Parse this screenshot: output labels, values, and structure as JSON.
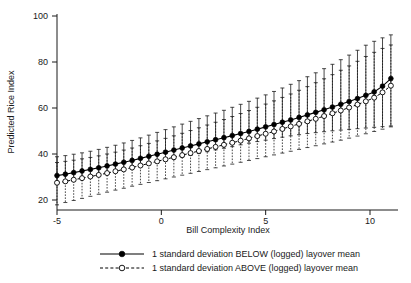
{
  "chart_data": {
    "type": "line",
    "title": "",
    "xlabel": "Bill Complexity Index",
    "ylabel": "Predicted Rice Index",
    "xlim": [
      -5.4,
      11.4
    ],
    "ylim": [
      14,
      102
    ],
    "xticks": [
      -5,
      0,
      5,
      10
    ],
    "xtick_labels": [
      "-5",
      "0",
      "5",
      "10"
    ],
    "yticks": [
      20,
      40,
      60,
      80,
      100
    ],
    "ytick_labels": [
      "20",
      "40",
      "60",
      "80",
      "100"
    ],
    "grid": false,
    "legend_position": "below",
    "error_bars": "95% confidence interval",
    "x": [
      -5.0,
      -4.6,
      -4.2,
      -3.8,
      -3.4,
      -3.0,
      -2.6,
      -2.2,
      -1.8,
      -1.4,
      -1.0,
      -0.6,
      -0.2,
      0.2,
      0.6,
      1.0,
      1.4,
      1.8,
      2.2,
      2.6,
      3.0,
      3.4,
      3.8,
      4.2,
      4.6,
      5.0,
      5.4,
      5.8,
      6.2,
      6.6,
      7.0,
      7.4,
      7.8,
      8.2,
      8.6,
      9.0,
      9.4,
      9.8,
      10.2,
      10.6,
      11.0
    ],
    "series": [
      {
        "name": "1 standard deviation BELOW (logged) layover mean",
        "marker": "filled-circle",
        "line": "solid",
        "values": [
          30.6,
          31.2,
          31.9,
          32.6,
          33.3,
          34.0,
          34.8,
          35.6,
          36.4,
          37.2,
          38.1,
          39.0,
          39.9,
          40.8,
          41.7,
          42.6,
          43.5,
          44.4,
          45.3,
          46.2,
          47.1,
          48.0,
          48.9,
          49.8,
          50.8,
          51.8,
          52.8,
          53.8,
          54.8,
          55.9,
          57.0,
          58.1,
          59.2,
          60.4,
          61.6,
          62.8,
          64.1,
          65.5,
          67.0,
          69.5,
          72.8
        ],
        "lower": [
          26.9,
          27.6,
          28.3,
          29.0,
          29.8,
          30.6,
          31.4,
          32.2,
          33.0,
          33.8,
          34.6,
          35.4,
          36.2,
          37.0,
          37.8,
          38.6,
          39.4,
          40.2,
          41.0,
          41.8,
          42.5,
          43.2,
          44.0,
          44.7,
          45.4,
          46.0,
          46.7,
          47.3,
          47.9,
          48.4,
          48.9,
          49.3,
          49.7,
          50.1,
          50.4,
          50.7,
          51.0,
          51.3,
          51.6,
          51.9,
          52.2
        ],
        "upper": [
          38.8,
          39.3,
          39.9,
          40.5,
          41.2,
          42.0,
          42.9,
          43.8,
          44.8,
          45.9,
          47.0,
          48.2,
          49.4,
          50.6,
          51.8,
          53.0,
          54.2,
          55.4,
          56.6,
          57.8,
          59.0,
          60.3,
          61.6,
          62.9,
          64.3,
          65.7,
          67.2,
          68.7,
          70.3,
          71.9,
          73.6,
          75.3,
          77.1,
          79.0,
          81.0,
          83.0,
          85.1,
          87.3,
          89.0,
          90.5,
          91.8
        ]
      },
      {
        "name": "1 standard deviation ABOVE (logged) layover mean",
        "marker": "open-circle",
        "line": "dashed",
        "values": [
          27.5,
          28.1,
          28.8,
          29.5,
          30.2,
          30.9,
          31.7,
          32.5,
          33.3,
          34.1,
          35.0,
          35.9,
          36.8,
          37.7,
          38.6,
          39.5,
          40.4,
          41.3,
          42.2,
          43.1,
          44.0,
          44.9,
          45.8,
          46.8,
          47.8,
          48.8,
          49.8,
          50.9,
          52.0,
          53.1,
          54.2,
          55.3,
          56.5,
          57.7,
          58.9,
          60.2,
          61.5,
          62.9,
          64.5,
          66.8,
          69.7
        ],
        "lower": [
          17.9,
          18.9,
          19.8,
          20.7,
          21.6,
          22.5,
          23.4,
          24.3,
          25.1,
          26.0,
          26.8,
          27.6,
          28.4,
          29.2,
          30.0,
          30.8,
          31.6,
          32.4,
          33.2,
          34.0,
          34.8,
          35.6,
          36.4,
          37.2,
          38.0,
          38.8,
          39.6,
          40.4,
          41.2,
          42.0,
          42.8,
          43.6,
          44.4,
          45.2,
          46.0,
          46.9,
          47.8,
          48.8,
          49.8,
          50.8,
          51.8
        ],
        "upper": [
          36.3,
          36.8,
          37.3,
          37.9,
          38.5,
          39.2,
          40.0,
          40.8,
          41.7,
          42.6,
          43.6,
          44.6,
          45.7,
          46.8,
          47.9,
          49.0,
          50.2,
          51.4,
          52.6,
          53.8,
          55.0,
          56.3,
          57.6,
          58.9,
          60.3,
          61.7,
          63.1,
          64.6,
          66.1,
          67.7,
          69.3,
          71.0,
          72.7,
          74.5,
          76.4,
          78.3,
          80.3,
          82.4,
          84.2,
          85.9,
          87.4
        ]
      }
    ]
  },
  "legend": {
    "items": [
      {
        "label": "1 standard deviation BELOW (logged) layover mean",
        "style": "solid-filled"
      },
      {
        "label": "1 standard deviation ABOVE (logged) layover mean",
        "style": "dashed-open"
      }
    ]
  },
  "colors": {
    "ink": "#1a1a1a",
    "background": "#ffffff",
    "marker_fill": "#000000",
    "marker_open": "#ffffff"
  }
}
